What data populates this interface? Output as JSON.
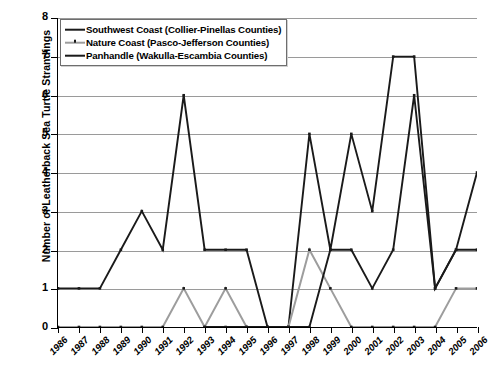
{
  "chart_data": {
    "type": "line",
    "title": "",
    "xlabel": "",
    "ylabel": "Number of Leatherback Sea Turtle Strandings",
    "categories": [
      "1986",
      "1987",
      "1988",
      "1989",
      "1990",
      "1991",
      "1992",
      "1993",
      "1994",
      "1995",
      "1996",
      "1997",
      "1998",
      "1999",
      "2000",
      "2001",
      "2002",
      "2003",
      "2004",
      "2005",
      "2006"
    ],
    "x": [
      1986,
      1987,
      1988,
      1989,
      1990,
      1991,
      1992,
      1993,
      1994,
      1995,
      1996,
      1997,
      1998,
      1999,
      2000,
      2001,
      2002,
      2003,
      2004,
      2005,
      2006
    ],
    "ylim": [
      0,
      8
    ],
    "yticks": [
      0,
      1,
      2,
      3,
      4,
      5,
      6,
      7,
      8
    ],
    "grid": true,
    "legend_position": "upper left (inside plot)",
    "series": [
      {
        "name": "Southwest Coast (Collier-Pinellas Counties)",
        "color": "#1a1a1a",
        "style": "solid",
        "values": [
          1,
          1,
          1,
          2,
          3,
          2,
          6,
          2,
          2,
          2,
          0,
          0,
          5,
          2,
          5,
          3,
          7,
          7,
          1,
          2,
          4
        ]
      },
      {
        "name": "Nature Coast (Pasco-Jefferson Counties)",
        "color": "#9d9d9d",
        "style": "solid-light",
        "values": [
          0,
          0,
          0,
          0,
          0,
          0,
          1,
          0,
          1,
          0,
          0,
          0,
          2,
          1,
          0,
          0,
          0,
          0,
          0,
          1,
          1
        ]
      },
      {
        "name": "Panhandle (Wakulla-Escambia Counties)",
        "color": "#1a1a1a",
        "style": "solid",
        "values": [
          null,
          null,
          null,
          null,
          null,
          null,
          null,
          0,
          0,
          0,
          0,
          0,
          0,
          2,
          2,
          1,
          2,
          6,
          1,
          2,
          2
        ]
      }
    ]
  },
  "legend": {
    "items": [
      {
        "label": "Southwest Coast (Collier-Pinellas Counties)",
        "swatch": "solid-dark-line"
      },
      {
        "label": "Nature Coast (Pasco-Jefferson Counties)",
        "swatch": "gray-dotted-line"
      },
      {
        "label": "Panhandle (Wakulla-Escambia Counties)",
        "swatch": "solid-dark-line"
      }
    ]
  },
  "axes": {
    "y_title": "Number of Leatherback Sea Turtle Strandings",
    "y_tick_labels": [
      "0",
      "1",
      "2",
      "3",
      "4",
      "5",
      "6",
      "7",
      "8"
    ],
    "x_tick_labels": [
      "1986",
      "1987",
      "1988",
      "1989",
      "1990",
      "1991",
      "1992",
      "1993",
      "1994",
      "1995",
      "1996",
      "1997",
      "1998",
      "1999",
      "2000",
      "2001",
      "2002",
      "2003",
      "2004",
      "2005",
      "2006"
    ]
  },
  "colors": {
    "series_dark": "#1a1a1a",
    "series_gray": "#9d9d9d",
    "gridline": "#9a9a9a",
    "axis": "#000000",
    "background": "#ffffff"
  }
}
